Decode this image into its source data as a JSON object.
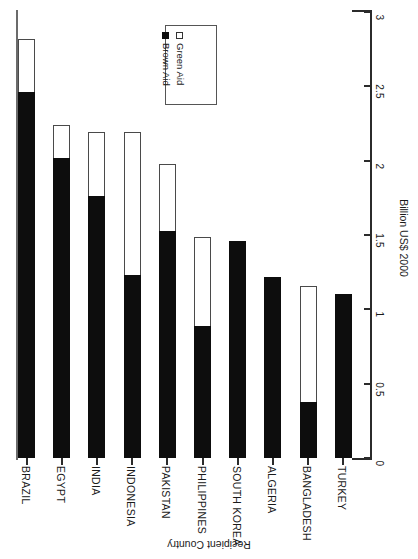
{
  "chart_data": {
    "type": "bar",
    "subtype": "stacked",
    "orientation": "rotated-90",
    "title": "",
    "xlabel": "Recipient Country",
    "ylabel": "Billion US$ 2000",
    "ylim": [
      0,
      3
    ],
    "yticks": [
      "3",
      "2.5",
      "2",
      "1.5",
      "1",
      "0.5",
      "0"
    ],
    "ytick_values": [
      3,
      2.5,
      2,
      1.5,
      1,
      0.5,
      0
    ],
    "grid": false,
    "legend_position": "upper-middle",
    "categories": [
      "BRAZIL",
      "EGYPT",
      "INDIA",
      "INDONESIA",
      "PAKISTAN",
      "PHILIPPINES",
      "SOUTH KOREA",
      "ALGERIA",
      "BANGLADESH",
      "TURKEY"
    ],
    "series": [
      {
        "name": "Brown Aid",
        "color": "#0d0d0d",
        "values": [
          2.46,
          2.02,
          1.76,
          1.23,
          1.53,
          0.89,
          1.46,
          1.22,
          0.38,
          1.1
        ]
      },
      {
        "name": "Green Aid",
        "color": "#ffffff",
        "values": [
          0.36,
          0.22,
          0.43,
          0.96,
          0.45,
          0.6,
          0.0,
          0.0,
          0.78,
          0.0
        ]
      }
    ],
    "totals": [
      2.82,
      2.24,
      2.19,
      2.19,
      1.98,
      1.49,
      1.46,
      1.22,
      1.16,
      1.1
    ]
  },
  "legend": {
    "items": [
      {
        "label": "Brown Aid",
        "swatch": "filled-square-icon"
      },
      {
        "label": "Green Aid",
        "swatch": "open-square-icon"
      }
    ]
  },
  "axes": {
    "value_axis_title": "Billion US$ 2000",
    "category_axis_title": "Recipient Country"
  }
}
